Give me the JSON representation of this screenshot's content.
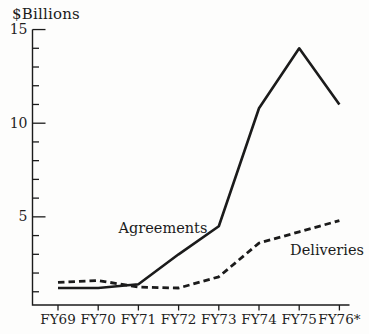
{
  "chart_data": {
    "type": "line",
    "unit_label": "$Billions",
    "categories": [
      "FY69",
      "FY70",
      "FY71",
      "FY72",
      "FY73",
      "FY74",
      "FY75",
      "FY76*"
    ],
    "series": [
      {
        "name": "Agreements",
        "style": "solid",
        "values": [
          1.2,
          1.2,
          1.4,
          3.0,
          4.5,
          10.8,
          14.0,
          11.0
        ]
      },
      {
        "name": "Deliveries",
        "style": "dashed",
        "values": [
          1.5,
          1.6,
          1.25,
          1.2,
          1.8,
          3.6,
          4.2,
          4.8
        ]
      }
    ],
    "ylim": [
      0,
      15
    ],
    "yticks_major": [
      5,
      10,
      15
    ],
    "ytick_minor_step": 1,
    "grid": false,
    "legend_position": "inline-annotations",
    "footnote_marker": "*"
  },
  "colors": {
    "ink": "#1b1b1b",
    "background": "#fdfdfc"
  }
}
